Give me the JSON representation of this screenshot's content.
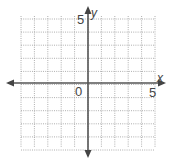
{
  "chart_data": {
    "type": "scatter",
    "title": "",
    "xlabel": "x",
    "ylabel": "y",
    "xlim": [
      -5,
      5
    ],
    "ylim": [
      -5,
      5
    ],
    "grid": true,
    "grid_step": 1,
    "tick_labels": {
      "origin": "0",
      "x_max": "5",
      "y_max": "5"
    },
    "series": [],
    "colors": {
      "axis": "#555555",
      "grid": "#9a9a9a",
      "text": "#444444"
    }
  },
  "labels": {
    "x_axis": "x",
    "y_axis": "y",
    "origin": "0",
    "x_five": "5",
    "y_five": "5"
  }
}
